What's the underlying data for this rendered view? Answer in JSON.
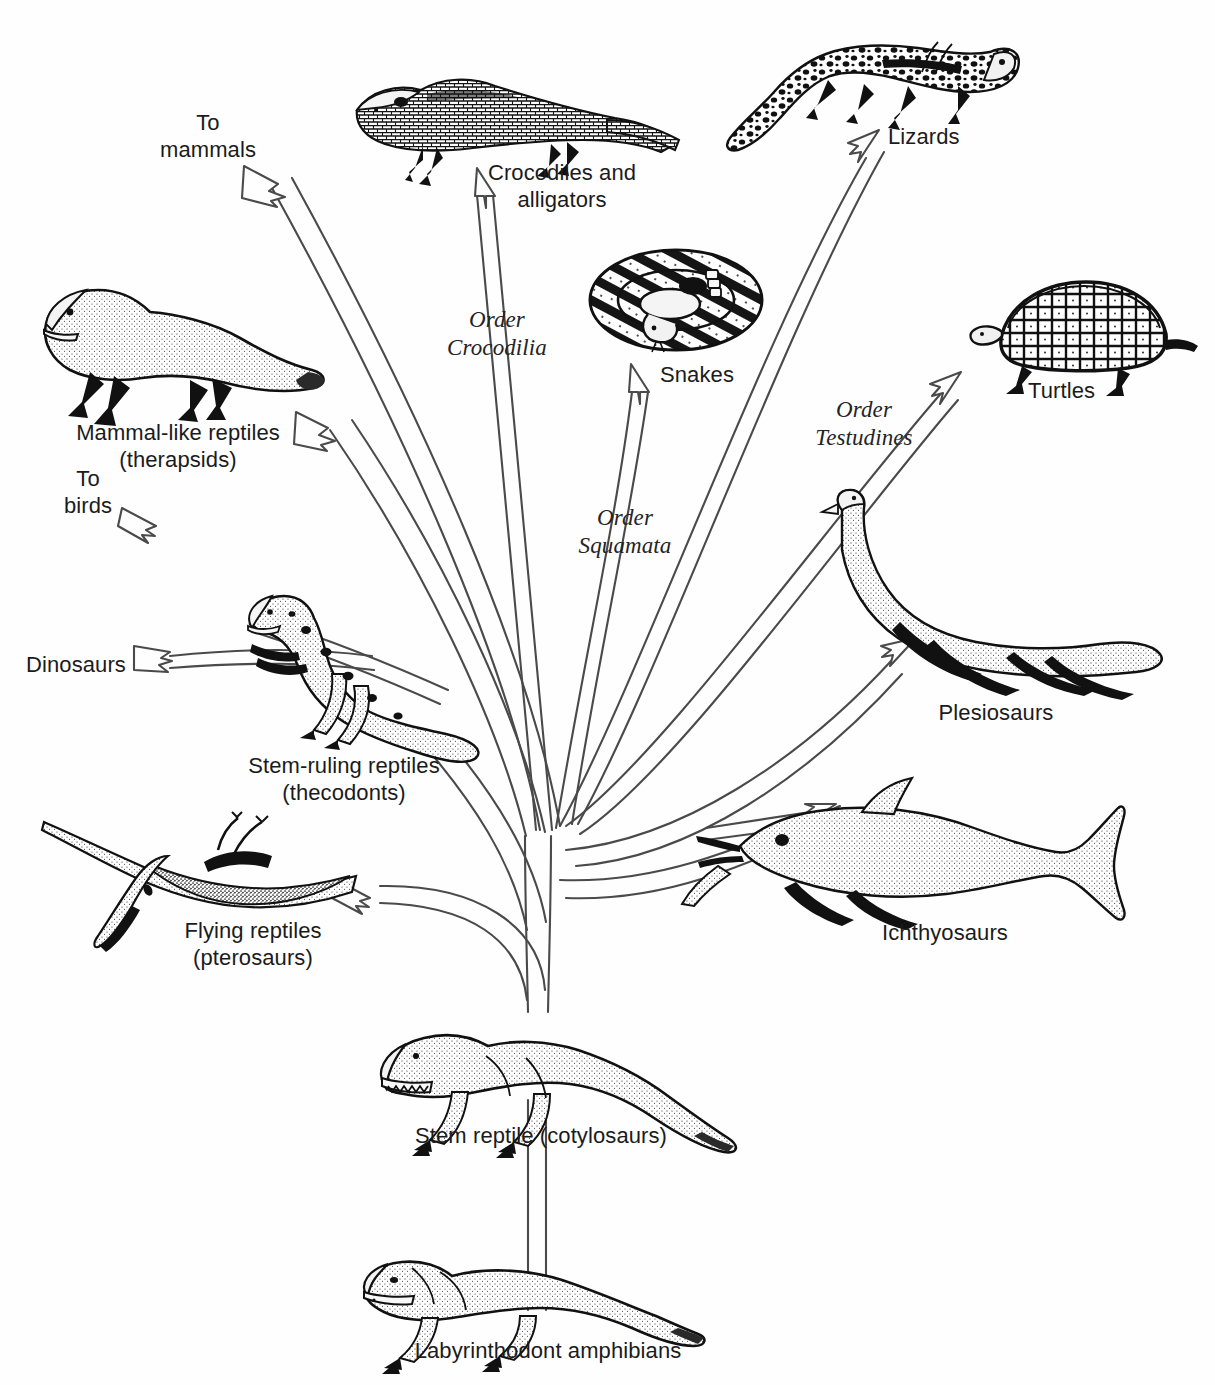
{
  "diagram": {
    "type": "evolutionary-tree",
    "root": "Labyrinthodont amphibians",
    "stem": "Stem reptile (cotylosaurs)"
  },
  "labels": {
    "to_mammals": "To\nmammals",
    "crocodiles": "Crocodiles and\nalligators",
    "lizards": "Lizards",
    "snakes": "Snakes",
    "turtles": "Turtles",
    "order_crocodilia": "Order\nCrocodilia",
    "order_squamata": "Order\nSquamata",
    "order_testudines": "Order\nTestudines",
    "mammal_like": "Mammal-like reptiles\n(therapsids)",
    "to_birds": "To\nbirds",
    "dinosaurs": "Dinosaurs",
    "stem_ruling": "Stem-ruling reptiles\n(thecodonts)",
    "flying_reptiles": "Flying reptiles\n(pterosaurs)",
    "plesiosaurs": "Plesiosaurs",
    "ichthyosaurs": "Ichthyosaurs",
    "stem_reptile": "Stem reptile (cotylosaurs)",
    "labyrinthodont": "Labyrinthodont amphibians"
  },
  "organisms": [
    {
      "name": "crocodile",
      "label": "Crocodiles and alligators"
    },
    {
      "name": "lizard",
      "label": "Lizards"
    },
    {
      "name": "snake",
      "label": "Snakes"
    },
    {
      "name": "turtle",
      "label": "Turtles"
    },
    {
      "name": "therapsid",
      "label": "Mammal-like reptiles (therapsids)"
    },
    {
      "name": "thecodont",
      "label": "Stem-ruling reptiles (thecodonts)"
    },
    {
      "name": "pterosaur",
      "label": "Flying reptiles (pterosaurs)"
    },
    {
      "name": "plesiosaur",
      "label": "Plesiosaurs"
    },
    {
      "name": "ichthyosaur",
      "label": "Ichthyosaurs"
    },
    {
      "name": "cotylosaur",
      "label": "Stem reptile (cotylosaurs)"
    },
    {
      "name": "labyrinthodont",
      "label": "Labyrinthodont amphibians"
    }
  ],
  "branches": [
    {
      "from": "stem-reptile",
      "to": "to-mammals",
      "order": ""
    },
    {
      "from": "stem-reptile",
      "to": "mammal-like-reptiles",
      "order": ""
    },
    {
      "from": "stem-reptile",
      "to": "crocodiles",
      "order": "Order Crocodilia"
    },
    {
      "from": "stem-reptile",
      "to": "snakes",
      "order": "Order Squamata"
    },
    {
      "from": "stem-reptile",
      "to": "lizards",
      "order": "Order Squamata"
    },
    {
      "from": "stem-reptile",
      "to": "turtles",
      "order": "Order Testudines"
    },
    {
      "from": "stem-reptile",
      "to": "plesiosaurs",
      "order": ""
    },
    {
      "from": "stem-reptile",
      "to": "ichthyosaurs",
      "order": ""
    },
    {
      "from": "stem-reptile",
      "to": "flying-reptiles",
      "order": ""
    },
    {
      "from": "stem-reptile",
      "to": "stem-ruling-reptiles",
      "order": ""
    },
    {
      "from": "stem-ruling-reptiles",
      "to": "to-birds",
      "order": ""
    },
    {
      "from": "stem-ruling-reptiles",
      "to": "dinosaurs",
      "order": ""
    },
    {
      "from": "labyrinthodont-amphibians",
      "to": "stem-reptile",
      "order": ""
    }
  ],
  "colors": {
    "background": "#fefefe",
    "ink": "#1a1a1a",
    "line": "#4a4a4a"
  }
}
